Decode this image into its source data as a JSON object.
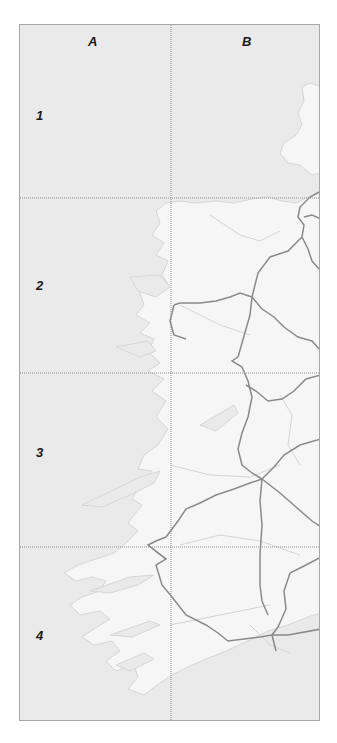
{
  "map": {
    "columns": [
      {
        "label": "A"
      },
      {
        "label": "B"
      }
    ],
    "rows": [
      {
        "label": "1"
      },
      {
        "label": "2"
      },
      {
        "label": "3"
      },
      {
        "label": "4"
      }
    ],
    "colors": {
      "sea": "#eaeaea",
      "land": "#f6f6f6",
      "coast": "#d6d6d6",
      "road": "#8a8a8a",
      "minor_road": "#d2d2d2",
      "grid": "#909090",
      "border": "#a8a8a8"
    }
  }
}
